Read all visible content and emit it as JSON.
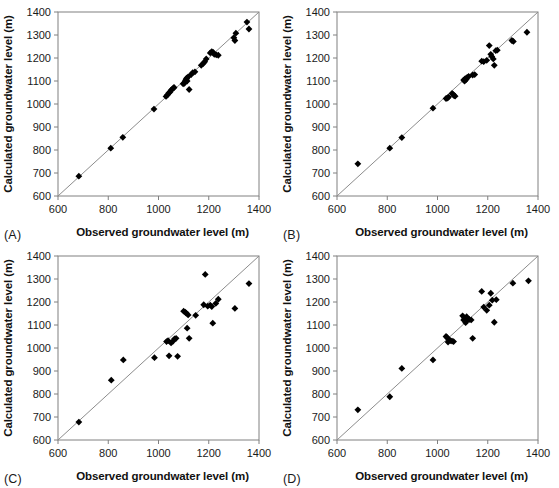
{
  "figure": {
    "background": "#ffffff",
    "marker_color": "#000000",
    "line_color": "#8c8c8c",
    "axis_color": "#808080",
    "width": 559,
    "height": 488
  },
  "axes_common": {
    "xlabel": "Observed groundwater level (m)",
    "ylabel": "Calculated groundwater level (m)",
    "xlim": [
      600,
      1400
    ],
    "ylim": [
      600,
      1400
    ],
    "xticks": [
      600,
      800,
      1000,
      1200,
      1400
    ],
    "yticks": [
      600,
      700,
      800,
      900,
      1000,
      1100,
      1200,
      1300,
      1400
    ],
    "xticklabels": [
      "600",
      "800",
      "1000",
      "1200",
      "1400"
    ],
    "yticklabels": [
      "600",
      "700",
      "800",
      "900",
      "1000",
      "1100",
      "1200",
      "1300",
      "1400"
    ],
    "grid": false,
    "legend": "none",
    "reference_line": "1:1 line"
  },
  "panels": [
    {
      "id": "A",
      "label": "(A)"
    },
    {
      "id": "B",
      "label": "(B)"
    },
    {
      "id": "C",
      "label": "(C)"
    },
    {
      "id": "D",
      "label": "(D)"
    }
  ],
  "chart_data": [
    {
      "type": "scatter",
      "panel": "A",
      "title": "(A)",
      "xlabel": "Observed groundwater level (m)",
      "ylabel": "Calculated groundwater level (m)",
      "xlim": [
        600,
        1400
      ],
      "ylim": [
        600,
        1400
      ],
      "xticks": [
        600,
        800,
        1000,
        1200,
        1400
      ],
      "yticks": [
        600,
        700,
        800,
        900,
        1000,
        1100,
        1200,
        1300,
        1400
      ],
      "grid": false,
      "legend": "none",
      "annotations": [
        "1:1 reference line from (600,600) to (1400,1400)"
      ],
      "series": [
        {
          "name": "Observed vs calculated groundwater level",
          "marker": "diamond",
          "points": [
            [
              683,
              686
            ],
            [
              810,
              808
            ],
            [
              858,
              855
            ],
            [
              982,
              978
            ],
            [
              1030,
              1033
            ],
            [
              1036,
              1040
            ],
            [
              1041,
              1048
            ],
            [
              1046,
              1052
            ],
            [
              1050,
              1060
            ],
            [
              1056,
              1066
            ],
            [
              1060,
              1070
            ],
            [
              1062,
              1072
            ],
            [
              1098,
              1088
            ],
            [
              1103,
              1090
            ],
            [
              1106,
              1098
            ],
            [
              1108,
              1103
            ],
            [
              1110,
              1108
            ],
            [
              1112,
              1112
            ],
            [
              1114,
              1100
            ],
            [
              1118,
              1118
            ],
            [
              1122,
              1063
            ],
            [
              1130,
              1128
            ],
            [
              1136,
              1136
            ],
            [
              1145,
              1140
            ],
            [
              1170,
              1168
            ],
            [
              1178,
              1176
            ],
            [
              1184,
              1184
            ],
            [
              1190,
              1196
            ],
            [
              1206,
              1222
            ],
            [
              1212,
              1228
            ],
            [
              1218,
              1224
            ],
            [
              1222,
              1216
            ],
            [
              1230,
              1214
            ],
            [
              1238,
              1212
            ],
            [
              1300,
              1288
            ],
            [
              1304,
              1276
            ],
            [
              1308,
              1308
            ],
            [
              1352,
              1356
            ],
            [
              1360,
              1326
            ]
          ]
        }
      ]
    },
    {
      "type": "scatter",
      "panel": "B",
      "title": "(B)",
      "xlabel": "Observed groundwater level (m)",
      "ylabel": "Calculated groundwater level (m)",
      "xlim": [
        600,
        1400
      ],
      "ylim": [
        600,
        1400
      ],
      "xticks": [
        600,
        800,
        1000,
        1200,
        1400
      ],
      "yticks": [
        600,
        700,
        800,
        900,
        1000,
        1100,
        1200,
        1300,
        1400
      ],
      "grid": false,
      "legend": "none",
      "annotations": [
        "1:1 reference line from (600,600) to (1400,1400)"
      ],
      "series": [
        {
          "name": "Observed vs calculated groundwater level",
          "marker": "diamond",
          "points": [
            [
              683,
              740
            ],
            [
              810,
              808
            ],
            [
              858,
              854
            ],
            [
              982,
              982
            ],
            [
              1034,
              1024
            ],
            [
              1040,
              1026
            ],
            [
              1044,
              1030
            ],
            [
              1058,
              1046
            ],
            [
              1062,
              1042
            ],
            [
              1066,
              1036
            ],
            [
              1070,
              1034
            ],
            [
              1104,
              1104
            ],
            [
              1108,
              1100
            ],
            [
              1110,
              1110
            ],
            [
              1114,
              1106
            ],
            [
              1118,
              1116
            ],
            [
              1124,
              1120
            ],
            [
              1140,
              1126
            ],
            [
              1148,
              1128
            ],
            [
              1176,
              1186
            ],
            [
              1184,
              1184
            ],
            [
              1196,
              1190
            ],
            [
              1206,
              1254
            ],
            [
              1212,
              1216
            ],
            [
              1216,
              1206
            ],
            [
              1222,
              1196
            ],
            [
              1226,
              1168
            ],
            [
              1232,
              1232
            ],
            [
              1238,
              1234
            ],
            [
              1296,
              1276
            ],
            [
              1302,
              1272
            ],
            [
              1356,
              1312
            ]
          ]
        }
      ]
    },
    {
      "type": "scatter",
      "panel": "C",
      "title": "(C)",
      "xlabel": "Observed groundwater level (m)",
      "ylabel": "Calculated groundwater level (m)",
      "xlim": [
        600,
        1400
      ],
      "ylim": [
        600,
        1400
      ],
      "xticks": [
        600,
        800,
        1000,
        1200,
        1400
      ],
      "yticks": [
        600,
        700,
        800,
        900,
        1000,
        1100,
        1200,
        1300,
        1400
      ],
      "grid": false,
      "legend": "none",
      "annotations": [
        "1:1 reference line from (600,600) to (1400,1400)"
      ],
      "series": [
        {
          "name": "Observed vs calculated groundwater level",
          "marker": "diamond",
          "points": [
            [
              683,
              678
            ],
            [
              812,
              860
            ],
            [
              860,
              948
            ],
            [
              984,
              958
            ],
            [
              1032,
              1028
            ],
            [
              1038,
              1032
            ],
            [
              1042,
              966
            ],
            [
              1050,
              1022
            ],
            [
              1058,
              1030
            ],
            [
              1064,
              1040
            ],
            [
              1070,
              1042
            ],
            [
              1076,
              964
            ],
            [
              1100,
              1160
            ],
            [
              1106,
              1156
            ],
            [
              1110,
              1152
            ],
            [
              1114,
              1086
            ],
            [
              1118,
              1144
            ],
            [
              1122,
              1042
            ],
            [
              1148,
              1142
            ],
            [
              1180,
              1188
            ],
            [
              1186,
              1320
            ],
            [
              1196,
              1182
            ],
            [
              1206,
              1186
            ],
            [
              1212,
              1180
            ],
            [
              1216,
              1108
            ],
            [
              1228,
              1194
            ],
            [
              1238,
              1212
            ],
            [
              1304,
              1172
            ],
            [
              1360,
              1280
            ]
          ]
        }
      ]
    },
    {
      "type": "scatter",
      "panel": "D",
      "title": "(D)",
      "xlabel": "Observed groundwater level (m)",
      "ylabel": "Calculated groundwater level (m)",
      "xlim": [
        600,
        1400
      ],
      "ylim": [
        600,
        1400
      ],
      "xticks": [
        600,
        800,
        1000,
        1200,
        1400
      ],
      "yticks": [
        600,
        700,
        800,
        900,
        1000,
        1100,
        1200,
        1300,
        1400
      ],
      "grid": false,
      "legend": "none",
      "annotations": [
        "1:1 reference line from (600,600) to (1400,1400)"
      ],
      "series": [
        {
          "name": "Observed vs calculated groundwater level",
          "marker": "diamond",
          "points": [
            [
              683,
              731
            ],
            [
              810,
              788
            ],
            [
              858,
              911
            ],
            [
              982,
              948
            ],
            [
              1034,
              1050
            ],
            [
              1038,
              1046
            ],
            [
              1042,
              1026
            ],
            [
              1046,
              1036
            ],
            [
              1052,
              1032
            ],
            [
              1058,
              1030
            ],
            [
              1064,
              1028
            ],
            [
              1100,
              1140
            ],
            [
              1104,
              1122
            ],
            [
              1108,
              1130
            ],
            [
              1112,
              1110
            ],
            [
              1116,
              1136
            ],
            [
              1120,
              1126
            ],
            [
              1126,
              1124
            ],
            [
              1134,
              1122
            ],
            [
              1140,
              1042
            ],
            [
              1176,
              1246
            ],
            [
              1184,
              1178
            ],
            [
              1196,
              1164
            ],
            [
              1206,
              1186
            ],
            [
              1212,
              1238
            ],
            [
              1218,
              1208
            ],
            [
              1226,
              1112
            ],
            [
              1234,
              1210
            ],
            [
              1300,
              1282
            ],
            [
              1362,
              1292
            ]
          ]
        }
      ]
    }
  ]
}
